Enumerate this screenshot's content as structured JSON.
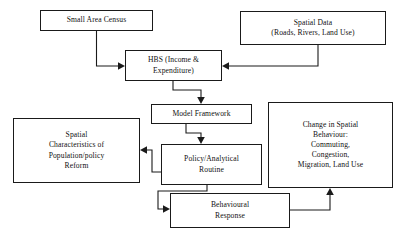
{
  "diagram": {
    "background_color": "#ffffff",
    "line_color": "#1a1a1a",
    "text_color": "#111111",
    "nodes": [
      {
        "id": "small_area_census",
        "label": "Small Area Census",
        "x": 40,
        "y": 10,
        "w": 113,
        "h": 21
      },
      {
        "id": "spatial_data",
        "label": "Spatial Data\n(Roads, Rivers, Land Use)",
        "x": 240,
        "y": 11,
        "w": 146,
        "h": 34
      },
      {
        "id": "hbs",
        "label": "HBS (Income &\nExpenditure)",
        "x": 125,
        "y": 50,
        "w": 97,
        "h": 31
      },
      {
        "id": "model_framework",
        "label": "Model Framework",
        "x": 151,
        "y": 104,
        "w": 101,
        "h": 20
      },
      {
        "id": "spatial_characteristics",
        "label": "Spatial\nCharacteristics of\nPopulation/policy\nReform",
        "x": 13,
        "y": 118,
        "w": 127,
        "h": 65
      },
      {
        "id": "change_in_spatial_behaviour",
        "label": "Change in Spatial\nBehaviour:\nCommuting,\nCongestion,\nMigration, Land Use",
        "x": 268,
        "y": 102,
        "w": 125,
        "h": 86
      },
      {
        "id": "policy_analytical_routine",
        "label": "Policy/Analytical\nRoutine",
        "x": 161,
        "y": 144,
        "w": 101,
        "h": 41
      },
      {
        "id": "behavioural_response",
        "label": "Behavioural\nResponse",
        "x": 170,
        "y": 193,
        "w": 120,
        "h": 35
      }
    ],
    "edges": [
      {
        "id": "census_to_hbs",
        "from": "small_area_census",
        "to": "hbs",
        "points": "96.5,31 96.5,66 120,66",
        "arrow_at": "120,66",
        "arrow_dir": "right"
      },
      {
        "id": "spatial_data_to_hbs",
        "from": "spatial_data",
        "to": "hbs",
        "points": "318,45 318,66 227,66",
        "arrow_at": "227,66",
        "arrow_dir": "left"
      },
      {
        "id": "hbs_to_model_framework",
        "from": "hbs",
        "to": "model_framework",
        "points": "173,81 173,90 201,90 201,99",
        "arrow_at": "201,99",
        "arrow_dir": "down"
      },
      {
        "id": "model_framework_to_policy",
        "from": "model_framework",
        "to": "policy_analytical_routine",
        "points": "186,124 186,133 201,133 201,139",
        "arrow_at": "201,139",
        "arrow_dir": "down"
      },
      {
        "id": "policy_to_spatial_characteristics",
        "from": "policy_analytical_routine",
        "to": "spatial_characteristics",
        "points": "161,172 152,172 152,150 145,150",
        "arrow_at": "145,150",
        "arrow_dir": "left"
      },
      {
        "id": "policy_to_behavioural_response",
        "from": "policy_analytical_routine",
        "to": "behavioural_response",
        "points": "207,185 207,191 158,191 158,209 165,209",
        "arrow_at": "165,209",
        "arrow_dir": "right"
      },
      {
        "id": "behavioural_response_to_change_spatial",
        "from": "behavioural_response",
        "to": "change_in_spatial_behaviour",
        "points": "290,210 330,210 330,193",
        "arrow_at": "330,193",
        "arrow_dir": "up"
      }
    ]
  }
}
